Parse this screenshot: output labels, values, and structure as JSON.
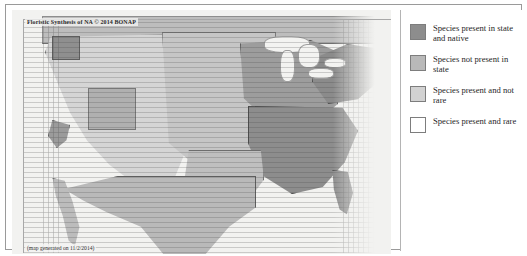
{
  "map": {
    "title": "Floristic Synthesis of NA © 2014 BONAP",
    "caption": "(map generated on 11/2/2014)"
  },
  "legend": {
    "items": [
      {
        "label": "Species present in state and native",
        "swatch_name": "swatch-present-native",
        "color": "#8d8d8d"
      },
      {
        "label": "Species not present in state",
        "swatch_name": "swatch-not-present",
        "color": "#b9b9b9"
      },
      {
        "label": "Species present and not rare",
        "swatch_name": "swatch-present-not-rare",
        "color": "#d2d2d2"
      },
      {
        "label": "Species present and rare",
        "swatch_name": "swatch-present-rare",
        "color": "#ffffff"
      }
    ]
  }
}
